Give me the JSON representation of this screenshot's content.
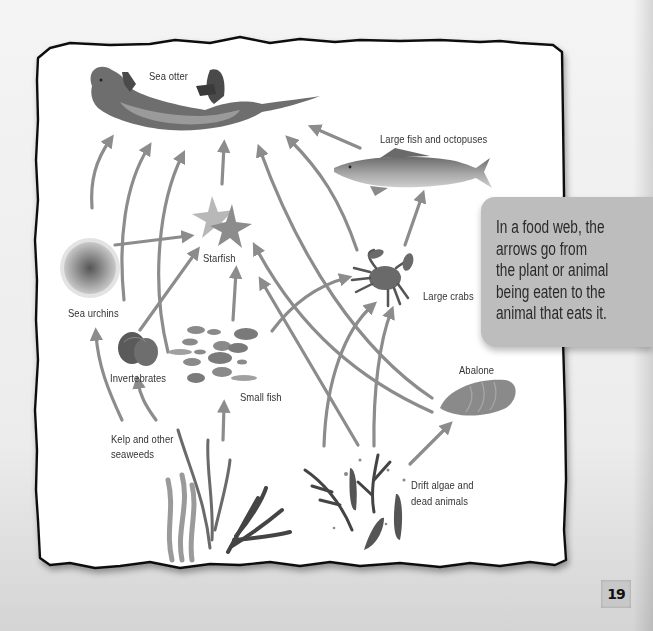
{
  "diagram": {
    "type": "food-web",
    "nodes": [
      {
        "id": "sea_otter",
        "label": "Sea otter"
      },
      {
        "id": "large_fish",
        "label": "Large fish and octopuses"
      },
      {
        "id": "starfish",
        "label": "Starfish"
      },
      {
        "id": "sea_urchins",
        "label": "Sea urchins"
      },
      {
        "id": "large_crabs",
        "label": "Large crabs"
      },
      {
        "id": "invertebrates",
        "label": "Invertebrates"
      },
      {
        "id": "small_fish",
        "label": "Small fish"
      },
      {
        "id": "abalone",
        "label": "Abalone"
      },
      {
        "id": "kelp",
        "label_line1": "Kelp and other",
        "label_line2": "seaweeds"
      },
      {
        "id": "drift",
        "label_line1": "Drift algae and",
        "label_line2": "dead animals"
      }
    ],
    "edges": [
      {
        "from": "sea_urchins",
        "to": "sea_otter"
      },
      {
        "from": "invertebrates",
        "to": "sea_otter"
      },
      {
        "from": "small_fish",
        "to": "sea_otter"
      },
      {
        "from": "starfish",
        "to": "sea_otter"
      },
      {
        "from": "abalone",
        "to": "sea_otter"
      },
      {
        "from": "large_crabs",
        "to": "sea_otter"
      },
      {
        "from": "large_fish",
        "to": "sea_otter"
      },
      {
        "from": "large_crabs",
        "to": "large_fish"
      },
      {
        "from": "sea_urchins",
        "to": "starfish"
      },
      {
        "from": "invertebrates",
        "to": "starfish"
      },
      {
        "from": "small_fish",
        "to": "starfish"
      },
      {
        "from": "abalone",
        "to": "starfish"
      },
      {
        "from": "drift",
        "to": "starfish"
      },
      {
        "from": "small_fish",
        "to": "large_crabs"
      },
      {
        "from": "drift",
        "to": "large_crabs"
      },
      {
        "from": "kelp",
        "to": "sea_urchins"
      },
      {
        "from": "kelp",
        "to": "invertebrates"
      },
      {
        "from": "kelp",
        "to": "small_fish"
      },
      {
        "from": "drift",
        "to": "abalone"
      }
    ]
  },
  "labels": {
    "sea_otter": "Sea otter",
    "large_fish": "Large fish and octopuses",
    "starfish": "Starfish",
    "sea_urchins": "Sea urchins",
    "large_crabs": "Large crabs",
    "invertebrates": "Invertebrates",
    "small_fish": "Small fish",
    "abalone": "Abalone",
    "kelp_line1": "Kelp and other",
    "kelp_line2": "seaweeds",
    "drift_line1": "Drift algae and",
    "drift_line2": "dead animals"
  },
  "info_box": {
    "lines": [
      "In a food web, the",
      "arrows go from",
      "the plant or animal",
      "being eaten to the",
      "animal that eats it."
    ]
  },
  "page_number": "19",
  "colors": {
    "arrow": "#8c8c8c",
    "border": "#111111",
    "info_box_bg": "#bdbdbd",
    "paper": "#ffffff"
  }
}
